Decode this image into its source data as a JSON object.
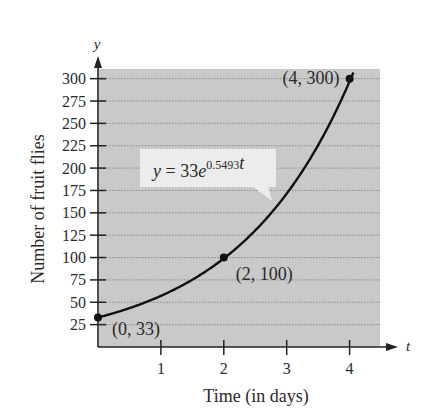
{
  "chart_data": {
    "type": "line",
    "title": "",
    "xlabel": "Time (in days)",
    "ylabel": "Number of fruit flies",
    "x_axis_var": "t",
    "y_axis_var": "y",
    "xlim": [
      0,
      4.2
    ],
    "ylim": [
      0,
      312
    ],
    "x_ticks": [
      1,
      2,
      3,
      4
    ],
    "y_ticks": [
      25,
      50,
      75,
      100,
      125,
      150,
      175,
      200,
      225,
      250,
      275,
      300
    ],
    "grid": "horizontal dotted",
    "equation": {
      "prefix": "y = 33e",
      "exponent": "0.5493t"
    },
    "model": {
      "a": 33,
      "k": 0.5493
    },
    "series": [
      {
        "name": "y = 33e^(0.5493t)",
        "x": [
          0,
          0.5,
          1,
          1.5,
          2,
          2.5,
          3,
          3.5,
          4
        ],
        "values": [
          33,
          43.6,
          57.5,
          75.8,
          99.2,
          130.4,
          172.0,
          227.0,
          297.5
        ]
      }
    ],
    "points": [
      {
        "x": 0,
        "y": 33,
        "label": "(0, 33)"
      },
      {
        "x": 2,
        "y": 100,
        "label": "(2, 100)"
      },
      {
        "x": 4,
        "y": 300,
        "label": "(4, 300)"
      }
    ],
    "colors": {
      "plot_bg": "#c9c9c9",
      "grid": "#8a8a8a",
      "curve": "#111111",
      "label_box": "#ececec"
    }
  }
}
